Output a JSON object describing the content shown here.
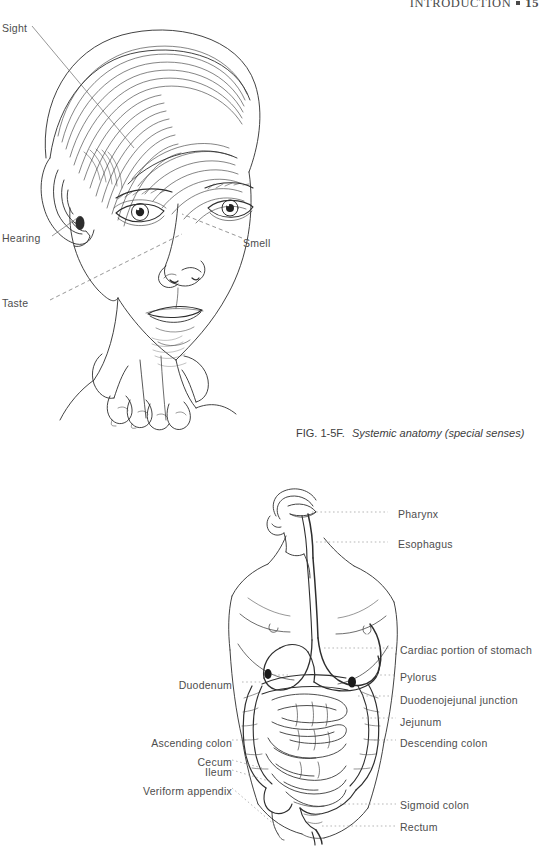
{
  "page": {
    "header": {
      "section": "INTRODUCTION",
      "separator": "square-bullet",
      "folio": "15"
    },
    "background": "#ffffff",
    "text_color": "#4d4d4d"
  },
  "figures": [
    {
      "id": "special-senses",
      "kind": "pen-and-ink anatomical illustration",
      "subject": "head and face of a young person, three-quarter view, with hands below the chin",
      "caption": {
        "number": "FIG. 1-5F.",
        "text": "Systemic anatomy (special senses)"
      },
      "labels": [
        {
          "name": "sight",
          "text": "Sight",
          "x": 2,
          "y": 22,
          "align": "left"
        },
        {
          "name": "hearing",
          "text": "Hearing",
          "x": 2,
          "y": 232,
          "align": "left"
        },
        {
          "name": "taste",
          "text": "Taste",
          "x": 2,
          "y": 297,
          "align": "left"
        },
        {
          "name": "smell",
          "text": "Smell",
          "x": 243,
          "y": 237,
          "align": "left"
        }
      ]
    },
    {
      "id": "digestive-system",
      "kind": "pen-and-ink anatomical illustration",
      "subject": "male torso with head tilted back showing pharynx, esophagus, stomach and intestines",
      "labels_right": [
        {
          "name": "pharynx",
          "text": "Pharynx",
          "y": 508
        },
        {
          "name": "esophagus",
          "text": "Esophagus",
          "y": 538
        },
        {
          "name": "cardiac-portion",
          "text": "Cardiac portion of stomach",
          "y": 644
        },
        {
          "name": "pylorus",
          "text": "Pylorus",
          "y": 671
        },
        {
          "name": "duodenojejunal",
          "text": "Duodenojejunal junction",
          "y": 694
        },
        {
          "name": "jejunum",
          "text": "Jejunum",
          "y": 716
        },
        {
          "name": "descending-colon",
          "text": "Descending colon",
          "y": 737
        },
        {
          "name": "sigmoid-colon",
          "text": "Sigmoid colon",
          "y": 799
        },
        {
          "name": "rectum",
          "text": "Rectum",
          "y": 821
        }
      ],
      "labels_left": [
        {
          "name": "duodenum",
          "text": "Duodenum",
          "y": 679
        },
        {
          "name": "ascending-colon",
          "text": "Ascending colon",
          "y": 737
        },
        {
          "name": "cecum",
          "text": "Cecum",
          "y": 756
        },
        {
          "name": "ileum",
          "text": "Ileum",
          "y": 766
        },
        {
          "name": "veriform-appendix",
          "text": "Veriform appendix",
          "y": 785
        }
      ]
    }
  ]
}
